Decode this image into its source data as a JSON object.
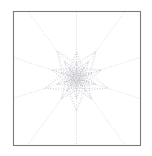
{
  "figure": {
    "title": "",
    "background_color": "#ffffff",
    "width": 152,
    "height": 156
  },
  "frame": {
    "name": "plot-frame",
    "x": 13,
    "y": 11,
    "width": 127,
    "height": 134,
    "stroke_color": "#7a7a7a",
    "stroke_width": 1.1,
    "fill": "none"
  },
  "chart_data": {
    "type": "scatter",
    "title": "",
    "subtitle": "",
    "xlabel": "",
    "ylabel": "",
    "xlim": [
      -1,
      1
    ],
    "ylim": [
      -1,
      1
    ],
    "grid": false,
    "legend": false,
    "legend_position": "none",
    "axis_ticks_visible": false,
    "center": {
      "x": 76.5,
      "y": 78.0
    },
    "symmetry_order": 5,
    "stroke_color": "#b9b9c4",
    "stroke_width": 0.55,
    "dash_pattern": [
      0.9,
      1.7
    ],
    "rays": {
      "name": "radial-rays",
      "count": 10,
      "angles_deg": [
        90,
        126,
        162,
        198,
        234,
        270,
        306,
        342,
        18,
        54
      ],
      "clipped_to_frame": true
    },
    "rosette_rings": [
      {
        "name": "outer-star",
        "points": 5,
        "outer_radius": 33.0,
        "inner_radius": 15.5,
        "rotation_deg": -90
      },
      {
        "name": "ring-2",
        "points": 5,
        "outer_radius": 26.0,
        "inner_radius": 12.2,
        "rotation_deg": -54
      },
      {
        "name": "ring-3",
        "points": 5,
        "outer_radius": 20.5,
        "inner_radius": 9.6,
        "rotation_deg": -18
      },
      {
        "name": "ring-4",
        "points": 5,
        "outer_radius": 16.2,
        "inner_radius": 7.6,
        "rotation_deg": 18
      },
      {
        "name": "ring-5",
        "points": 5,
        "outer_radius": 12.8,
        "inner_radius": 6.0,
        "rotation_deg": 54
      },
      {
        "name": "ring-6",
        "points": 5,
        "outer_radius": 10.1,
        "inner_radius": 4.7,
        "rotation_deg": 90
      },
      {
        "name": "ring-7",
        "points": 5,
        "outer_radius": 8.0,
        "inner_radius": 3.7,
        "rotation_deg": 126
      },
      {
        "name": "ring-8",
        "points": 5,
        "outer_radius": 6.3,
        "inner_radius": 3.0,
        "rotation_deg": 162
      },
      {
        "name": "ring-9",
        "points": 5,
        "outer_radius": 5.0,
        "inner_radius": 2.3,
        "rotation_deg": 198
      },
      {
        "name": "ring-10",
        "points": 5,
        "outer_radius": 3.9,
        "inner_radius": 1.8,
        "rotation_deg": 234
      },
      {
        "name": "ring-11",
        "points": 5,
        "outer_radius": 3.1,
        "inner_radius": 1.5,
        "rotation_deg": 270
      },
      {
        "name": "ring-12",
        "points": 5,
        "outer_radius": 2.4,
        "inner_radius": 1.1,
        "rotation_deg": 306
      }
    ],
    "chords": {
      "name": "pentagram-chords",
      "ring_indices": [
        0,
        1,
        2,
        3,
        4,
        5,
        6
      ],
      "skip": 2
    },
    "spokes": {
      "name": "inner-spokes",
      "ring_indices": [
        0,
        1,
        2,
        3,
        4,
        5,
        6,
        7
      ],
      "count_per_ring": 10
    }
  }
}
